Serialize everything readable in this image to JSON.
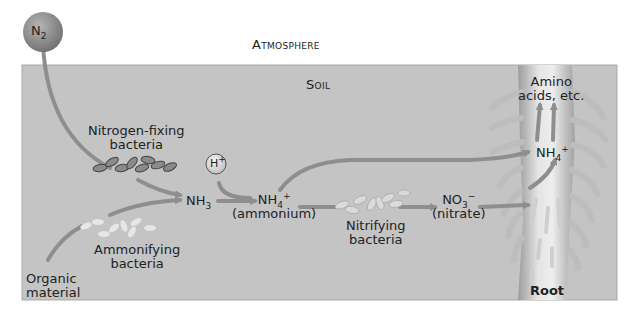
{
  "diagram": {
    "regions": {
      "atmosphere": "Atmosphere",
      "soil": "Soil"
    },
    "molecules": {
      "n2": {
        "base": "N",
        "sub": "2"
      },
      "h_plus": {
        "base": "H",
        "sup": "+"
      },
      "nh3": {
        "base": "NH",
        "sub": "3"
      },
      "nh4_soil": {
        "base": "NH",
        "sub": "4",
        "sup": "+",
        "caption": "(ammonium)"
      },
      "no3": {
        "base": "NO",
        "sub": "3",
        "sup": "−",
        "caption": "(nitrate)"
      },
      "nh4_root": {
        "base": "NH",
        "sub": "4",
        "sup": "+"
      }
    },
    "labels": {
      "nitrogen_fixing_line1": "Nitrogen-fixing",
      "nitrogen_fixing_line2": "bacteria",
      "ammonifying_line1": "Ammonifying",
      "ammonifying_line2": "bacteria",
      "organic_line1": "Organic",
      "organic_line2": "material",
      "nitrifying_line1": "Nitrifying",
      "nitrifying_line2": "bacteria",
      "amino_line1": "Amino",
      "amino_line2": "acids, etc.",
      "root": "Root"
    },
    "colors": {
      "soil": "#c4c4c4",
      "soil_border": "#a8a8a8",
      "arrow": "#8e8e8e",
      "root": "#d9d9d9",
      "root_shade": "#a9a9a9",
      "dark_bacteria": "#8a8a8a",
      "light_bacteria": "#e6e6e6",
      "sphere": "#8f8f8f"
    }
  }
}
